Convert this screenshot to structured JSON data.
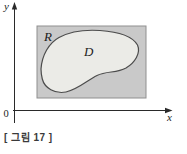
{
  "figure": {
    "caption": "[ 그림 17 ]",
    "labels": {
      "y_axis": "y",
      "x_axis": "x",
      "origin": "0",
      "rectangle": "R",
      "region": "D"
    },
    "colors": {
      "rectangle_fill": "#c9c9c9",
      "rectangle_border": "#8f8f8f",
      "region_fill": "#ebebe7",
      "region_stroke": "#4c4c4c",
      "axis": "#2a2a2a",
      "label_text": "#1c1c1c",
      "caption_text": "#3a3a3a"
    }
  }
}
